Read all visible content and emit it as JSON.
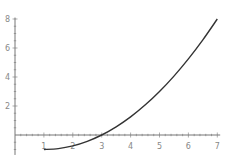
{
  "chart_data": {
    "type": "line",
    "title": "",
    "xlabel": "",
    "ylabel": "",
    "xlim": [
      0,
      7.1
    ],
    "ylim": [
      -1.1,
      8.1
    ],
    "x_ticks": [
      "1",
      "2",
      "3",
      "4",
      "5",
      "6",
      "7"
    ],
    "y_ticks": [
      "2",
      "4",
      "6",
      "8"
    ],
    "grid": false,
    "legend": null,
    "series": [
      {
        "name": "f(x) = (x-3)(x+1)/4",
        "x": [
          1,
          1.5,
          2,
          2.5,
          3,
          3.5,
          4,
          4.5,
          5,
          5.5,
          6,
          6.5,
          7
        ],
        "values": [
          -1,
          -0.9375,
          -0.75,
          -0.4375,
          0,
          0.5625,
          1.25,
          2.0625,
          3,
          4.0625,
          5.25,
          6.5625,
          8
        ]
      }
    ],
    "colors": {
      "curve": "#333333",
      "axis": "#777777",
      "labels": "#888888"
    }
  }
}
